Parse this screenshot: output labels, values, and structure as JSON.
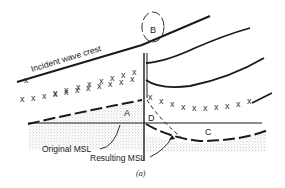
{
  "figure": {
    "caption": "(a)",
    "labels": {
      "incident_wave_crest": "Incident wave crest",
      "original_msl": "Original MSL",
      "resulting_msl": "Resulting MSL",
      "region_a": "A",
      "region_b": "B",
      "region_c": "C",
      "region_d": "D"
    },
    "marker_glyph": "x",
    "colors": {
      "ink": "#1a1a1a",
      "stipple": "#9a9a9a",
      "background": "#ffffff"
    }
  }
}
